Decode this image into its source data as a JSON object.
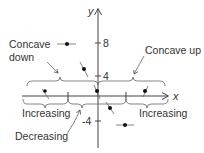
{
  "diagram": {
    "axes": {
      "x_label": "x",
      "y_label": "y",
      "y_ticks": [
        {
          "label": "8",
          "value": 8
        },
        {
          "label": "4",
          "value": 4
        },
        {
          "label": "-4",
          "value": -4
        }
      ]
    },
    "annotations": {
      "concave_down": [
        "Concave",
        "down"
      ],
      "concave_up": "Concave up",
      "increasing_left": "Increasing",
      "decreasing": "Decreasing",
      "increasing_right": "Increasing"
    },
    "colors": {
      "ink": "#333333",
      "background": "#ffffff"
    }
  }
}
